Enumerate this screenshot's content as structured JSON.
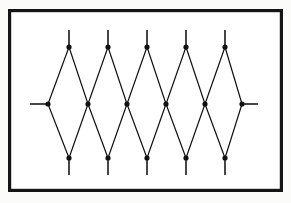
{
  "figure": {
    "kind": "diamond-lattice-diagram",
    "caption": "",
    "background_color": "#fbfbf9",
    "ink_color": "#111111",
    "frame": {
      "name": "figure-border",
      "x": 8,
      "y": 9,
      "width": 275,
      "height": 183,
      "stroke_width": 3.2,
      "color": "#151515"
    },
    "geometry": {
      "top_row_y": 47,
      "middle_row_y": 104,
      "bottom_row_y": 158,
      "top_stub_end_y": 30,
      "bottom_stub_end_y": 175,
      "left_stub_end_x": 30,
      "right_stub_end_x": 258,
      "edge_stroke_width": 1.2,
      "node_radius": 2.6
    },
    "nodes": {
      "top": [
        {
          "label": "T1",
          "x": 69,
          "y": 47
        },
        {
          "label": "T2",
          "x": 108,
          "y": 47
        },
        {
          "label": "T3",
          "x": 147,
          "y": 47
        },
        {
          "label": "T4",
          "x": 186,
          "y": 47
        },
        {
          "label": "T5",
          "x": 225,
          "y": 47
        }
      ],
      "middle": [
        {
          "label": "M0",
          "x": 48,
          "y": 104
        },
        {
          "label": "M1",
          "x": 88,
          "y": 104
        },
        {
          "label": "M2",
          "x": 127,
          "y": 104
        },
        {
          "label": "M3",
          "x": 166,
          "y": 104
        },
        {
          "label": "M4",
          "x": 205,
          "y": 104
        },
        {
          "label": "M5",
          "x": 242,
          "y": 104
        }
      ],
      "bottom": [
        {
          "label": "B1",
          "x": 69,
          "y": 158
        },
        {
          "label": "B2",
          "x": 108,
          "y": 158
        },
        {
          "label": "B3",
          "x": 147,
          "y": 158
        },
        {
          "label": "B4",
          "x": 186,
          "y": 158
        },
        {
          "label": "B5",
          "x": 225,
          "y": 158
        }
      ]
    },
    "edges": [
      {
        "from": "M0",
        "to": "T1"
      },
      {
        "from": "T1",
        "to": "M1"
      },
      {
        "from": "M1",
        "to": "T2"
      },
      {
        "from": "T2",
        "to": "M2"
      },
      {
        "from": "M2",
        "to": "T3"
      },
      {
        "from": "T3",
        "to": "M3"
      },
      {
        "from": "M3",
        "to": "T4"
      },
      {
        "from": "T4",
        "to": "M4"
      },
      {
        "from": "M4",
        "to": "T5"
      },
      {
        "from": "T5",
        "to": "M5"
      },
      {
        "from": "M0",
        "to": "B1"
      },
      {
        "from": "B1",
        "to": "M1"
      },
      {
        "from": "M1",
        "to": "B2"
      },
      {
        "from": "B2",
        "to": "M2"
      },
      {
        "from": "M2",
        "to": "B3"
      },
      {
        "from": "B3",
        "to": "M3"
      },
      {
        "from": "M3",
        "to": "B4"
      },
      {
        "from": "B4",
        "to": "M4"
      },
      {
        "from": "M4",
        "to": "B5"
      },
      {
        "from": "B5",
        "to": "M5"
      }
    ],
    "stubs": [
      {
        "name": "stub-top-1",
        "x1": 69,
        "y1": 47,
        "x2": 69,
        "y2": 30
      },
      {
        "name": "stub-top-2",
        "x1": 108,
        "y1": 47,
        "x2": 108,
        "y2": 30
      },
      {
        "name": "stub-top-3",
        "x1": 147,
        "y1": 47,
        "x2": 147,
        "y2": 30
      },
      {
        "name": "stub-top-4",
        "x1": 186,
        "y1": 47,
        "x2": 186,
        "y2": 30
      },
      {
        "name": "stub-top-5",
        "x1": 225,
        "y1": 47,
        "x2": 225,
        "y2": 30
      },
      {
        "name": "stub-bottom-1",
        "x1": 69,
        "y1": 158,
        "x2": 69,
        "y2": 175
      },
      {
        "name": "stub-bottom-2",
        "x1": 108,
        "y1": 158,
        "x2": 108,
        "y2": 175
      },
      {
        "name": "stub-bottom-3",
        "x1": 147,
        "y1": 158,
        "x2": 147,
        "y2": 175
      },
      {
        "name": "stub-bottom-4",
        "x1": 186,
        "y1": 158,
        "x2": 186,
        "y2": 175
      },
      {
        "name": "stub-bottom-5",
        "x1": 225,
        "y1": 158,
        "x2": 225,
        "y2": 175
      },
      {
        "name": "stub-left",
        "x1": 48,
        "y1": 104,
        "x2": 30,
        "y2": 104
      },
      {
        "name": "stub-right",
        "x1": 242,
        "y1": 104,
        "x2": 258,
        "y2": 104
      }
    ]
  }
}
